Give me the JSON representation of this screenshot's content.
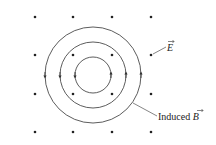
{
  "diagram": {
    "title": "",
    "dot_grid": {
      "columns_x": [
        35,
        73,
        112,
        151
      ],
      "rows_y": [
        17,
        55,
        94,
        132
      ],
      "color": "#222222",
      "meaning": "E field pointing out of page"
    },
    "center": {
      "x": 93,
      "y": 75
    },
    "circles": [
      {
        "r": 18
      },
      {
        "r": 33
      },
      {
        "r": 48
      }
    ],
    "circle_color": "#333333",
    "labels": {
      "e_field": "E",
      "induced_b_prefix": "Induced ",
      "induced_b_symbol": "B"
    }
  }
}
